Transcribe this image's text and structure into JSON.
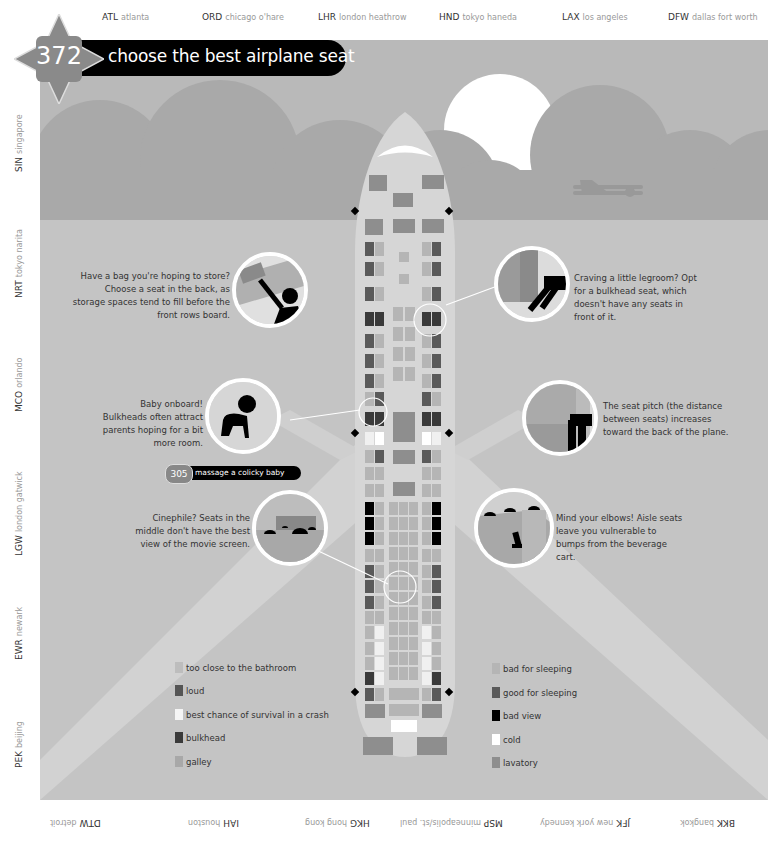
{
  "badge": {
    "number": "372"
  },
  "title": "choose the best airplane seat",
  "airports": {
    "top": [
      {
        "code": "ATL",
        "name": "atlanta"
      },
      {
        "code": "ORD",
        "name": "chicago o'hare"
      },
      {
        "code": "LHR",
        "name": "london heathrow"
      },
      {
        "code": "HND",
        "name": "tokyo haneda"
      },
      {
        "code": "LAX",
        "name": "los angeles"
      },
      {
        "code": "DFW",
        "name": "dallas fort worth"
      }
    ],
    "left": [
      {
        "code": "SIN",
        "name": "singapore"
      },
      {
        "code": "NRT",
        "name": "tokyo narita"
      },
      {
        "code": "MCO",
        "name": "orlando"
      },
      {
        "code": "LGW",
        "name": "london gatwick"
      },
      {
        "code": "EWR",
        "name": "newark"
      },
      {
        "code": "PEK",
        "name": "beijing"
      }
    ],
    "bottom": [
      {
        "code": "BKK",
        "name": "bangkok"
      },
      {
        "code": "JFK",
        "name": "new york kennedy"
      },
      {
        "code": "MSP",
        "name": "minneapolis/st. paul"
      },
      {
        "code": "HKG",
        "name": "hong kong"
      },
      {
        "code": "IAH",
        "name": "houston"
      },
      {
        "code": "DTW",
        "name": "detroit"
      }
    ]
  },
  "callouts": {
    "storage": "Have a bag you're hoping to store? Choose a seat in the back, as storage spaces tend to fill before the front rows board.",
    "legroom": "Craving a little legroom? Opt for a bulkhead seat, which doesn't have any seats in front of it.",
    "baby": "Baby onboard! Bulkheads often attract parents hoping for a bit more room.",
    "pitch": "The seat pitch (the distance between seats) increases toward the back of the plane.",
    "cinephile": "Cinephile? Seats in the middle don't have the best view of the movie screen.",
    "elbows": "Mind your elbows! Aisle seats leave you vulnerable to bumps from the beverage cart."
  },
  "crossref": {
    "number": "305",
    "label": "massage a colicky baby"
  },
  "legend": {
    "left": [
      {
        "label": "too close to the bathroom",
        "color": "#bdbdbd"
      },
      {
        "label": "loud",
        "color": "#555555"
      },
      {
        "label": "best chance of survival in a crash",
        "color": "#f5f5f5"
      },
      {
        "label": "bulkhead",
        "color": "#3a3a3a"
      },
      {
        "label": "galley",
        "color": "#a8a8a8"
      }
    ],
    "right": [
      {
        "label": "bad for sleeping",
        "color": "#b5b5b5"
      },
      {
        "label": "good for sleeping",
        "color": "#5a5a5a"
      },
      {
        "label": "bad view",
        "color": "#000000"
      },
      {
        "label": "cold",
        "color": "#ffffff"
      },
      {
        "label": "lavatory",
        "color": "#8e8e8e"
      }
    ]
  }
}
